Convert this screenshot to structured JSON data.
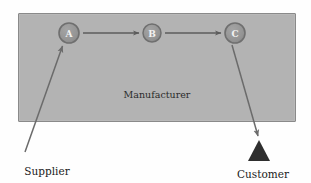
{
  "diagram": {
    "container": {
      "name": "manufacturer-box",
      "caption": "Manufacturer",
      "fill": "#b3b3b3",
      "border": "#8a8a8a"
    },
    "background": "#fefefe",
    "nodes": [
      {
        "id": "A",
        "label": "A",
        "cx": 69,
        "cy": 33,
        "r": 10,
        "fill": "#949494",
        "ring": "#6f6f6f",
        "text_color": "#f2f2f2"
      },
      {
        "id": "B",
        "label": "B",
        "cx": 152,
        "cy": 33,
        "r": 9,
        "fill": "#949494",
        "ring": "#6f6f6f",
        "text_color": "#f2f2f2"
      },
      {
        "id": "C",
        "label": "C",
        "cx": 235,
        "cy": 33,
        "r": 10,
        "fill": "#949494",
        "ring": "#6f6f6f",
        "text_color": "#f2f2f2"
      }
    ],
    "flow_arrows": [
      {
        "name": "arrow-a-to-b",
        "from": "A",
        "to": "B",
        "x1": 83,
        "y1": 33,
        "x2": 141,
        "y2": 33,
        "color": "#5c5c5c"
      },
      {
        "name": "arrow-b-to-c",
        "from": "B",
        "to": "C",
        "x1": 165,
        "y1": 33,
        "x2": 223,
        "y2": 33,
        "color": "#5c5c5c"
      }
    ],
    "external_arrows": [
      {
        "name": "arrow-supplier-to-a",
        "label": "Supplier",
        "x1": 25,
        "y1": 152,
        "x2": 62,
        "y2": 45,
        "color": "#6b6b6b"
      },
      {
        "name": "arrow-c-to-customer",
        "label": "Customer",
        "x1": 232,
        "y1": 45,
        "x2": 258,
        "y2": 138,
        "color": "#6b6b6b"
      }
    ],
    "customer_marker": {
      "name": "customer-triangle",
      "fill": "#2e2e2e",
      "cx": 259,
      "top_y": 140,
      "base_y": 161,
      "half_width": 11
    },
    "captions": [
      {
        "name": "supplier-label",
        "text": "Supplier",
        "x": 47,
        "y": 175
      },
      {
        "name": "customer-label",
        "text": "Customer",
        "x": 263,
        "y": 178
      }
    ],
    "manufacturer_caption_pos": {
      "x": 157,
      "y": 98
    }
  }
}
